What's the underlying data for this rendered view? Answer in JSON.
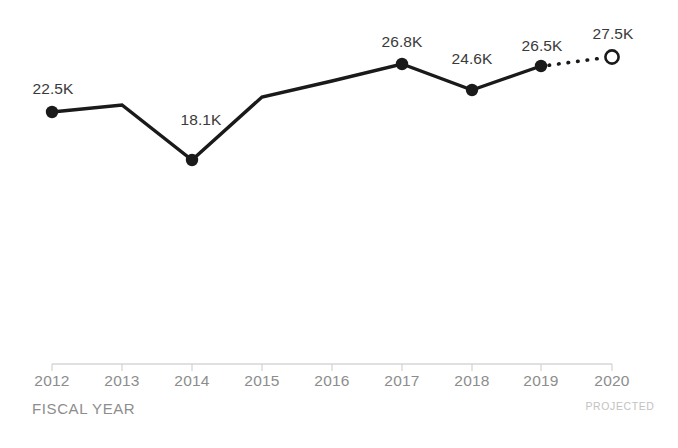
{
  "chart_data": {
    "type": "line",
    "title": "",
    "subtitle": "",
    "xlabel": "FISCAL YEAR",
    "ylabel": "",
    "grid": false,
    "legend": null,
    "xlim": [
      2012,
      2020
    ],
    "ylim": [
      17000,
      28500
    ],
    "x": [
      2012,
      2013,
      2014,
      2015,
      2016,
      2017,
      2018,
      2019,
      2020
    ],
    "categories": [
      "2012",
      "2013",
      "2014",
      "2015",
      "2016",
      "2017",
      "2018",
      "2019",
      "2020"
    ],
    "series": [
      {
        "name": "Actual",
        "style": "solid",
        "color": "#1a1a1a",
        "values": [
          22500,
          21900,
          18100,
          23900,
          25300,
          26800,
          24600,
          26500,
          null
        ]
      },
      {
        "name": "Projected",
        "style": "dotted",
        "color": "#1a1a1a",
        "values": [
          null,
          null,
          null,
          null,
          null,
          null,
          null,
          26500,
          27500
        ]
      }
    ],
    "points": [
      {
        "year": "2012",
        "value": 22500,
        "label": "22.5K",
        "marker": "filled",
        "labeled": true,
        "px": 52,
        "py": 112,
        "lx": 53,
        "ly": 80
      },
      {
        "year": "2013",
        "value": 21900,
        "label": "",
        "marker": "none",
        "labeled": false,
        "px": 122,
        "py": 105,
        "lx": 122,
        "ly": 0
      },
      {
        "year": "2014",
        "value": 18100,
        "label": "18.1K",
        "marker": "filled",
        "labeled": true,
        "px": 192,
        "py": 160,
        "lx": 201,
        "ly": 111
      },
      {
        "year": "2015",
        "value": 23900,
        "label": "",
        "marker": "none",
        "labeled": false,
        "px": 262,
        "py": 97,
        "lx": 262,
        "ly": 0
      },
      {
        "year": "2016",
        "value": 25300,
        "label": "",
        "marker": "none",
        "labeled": false,
        "px": 332,
        "py": 81,
        "lx": 332,
        "ly": 0
      },
      {
        "year": "2017",
        "value": 26800,
        "label": "26.8K",
        "marker": "filled",
        "labeled": true,
        "px": 402,
        "py": 64,
        "lx": 402,
        "ly": 33
      },
      {
        "year": "2018",
        "value": 24600,
        "label": "24.6K",
        "marker": "filled",
        "labeled": true,
        "px": 472,
        "py": 90,
        "lx": 472,
        "ly": 50
      },
      {
        "year": "2019",
        "value": 26500,
        "label": "26.5K",
        "marker": "filled",
        "labeled": true,
        "px": 541,
        "py": 66,
        "lx": 542,
        "ly": 37
      },
      {
        "year": "2020",
        "value": 27500,
        "label": "27.5K",
        "marker": "hollow",
        "labeled": true,
        "px": 612,
        "py": 57,
        "lx": 613,
        "ly": 25
      }
    ],
    "annotations": [
      {
        "name": "projected-note",
        "text": "PROJECTED",
        "x": 620,
        "y": 400
      }
    ],
    "axis": {
      "line_color": "#d6d6d6",
      "tick_color": "#d6d6d6",
      "label_color": "#8d8d8d",
      "y": 364,
      "x_start": 52,
      "x_end": 612,
      "tick_height": 7,
      "tick_label_y": 372
    },
    "colors": {
      "line": "#1a1a1a",
      "marker_fill": "#1a1a1a",
      "marker_hollow_fill": "#ffffff",
      "value_label": "#3a3a3a",
      "axis": "#d6d6d6",
      "axis_label": "#8d8d8d",
      "projected_note": "#c2c2c2",
      "background": "#ffffff"
    }
  }
}
